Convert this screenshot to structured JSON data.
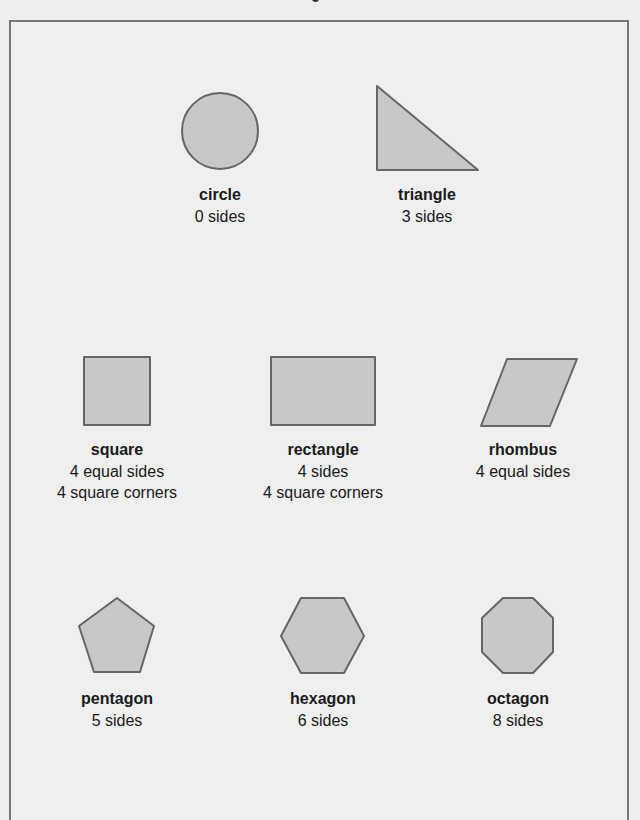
{
  "style": {
    "fill": "#c8c8c8",
    "stroke": "#666666",
    "background": "#eeeeee",
    "frame_border": "#777777"
  },
  "shapes": [
    {
      "name": "circle",
      "lines": [
        "0 sides"
      ]
    },
    {
      "name": "triangle",
      "lines": [
        "3 sides"
      ]
    },
    {
      "name": "square",
      "lines": [
        "4 equal sides",
        "4 square corners"
      ]
    },
    {
      "name": "rectangle",
      "lines": [
        "4 sides",
        "4 square corners"
      ]
    },
    {
      "name": "rhombus",
      "lines": [
        "4 equal sides"
      ]
    },
    {
      "name": "pentagon",
      "lines": [
        "5 sides"
      ]
    },
    {
      "name": "hexagon",
      "lines": [
        "6 sides"
      ]
    },
    {
      "name": "octagon",
      "lines": [
        "8 sides"
      ]
    }
  ]
}
